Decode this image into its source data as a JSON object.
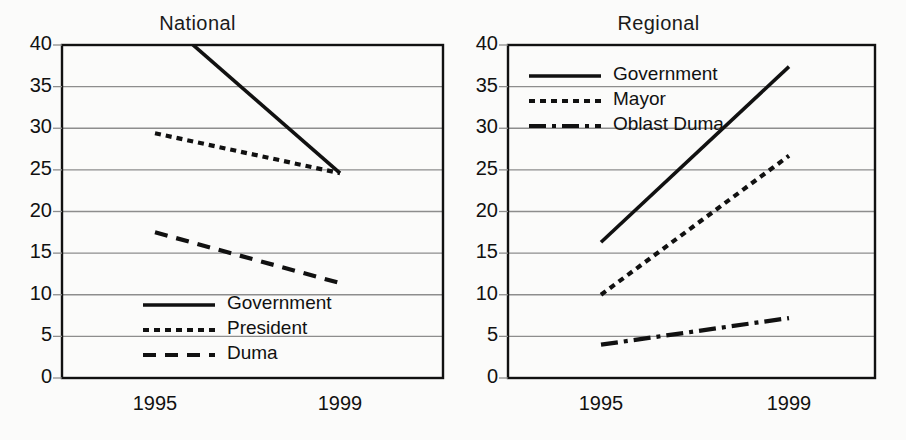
{
  "page": {
    "background_color": "#fbfbfa",
    "ink_color": "#111111",
    "grid_color": "#8d8d8d"
  },
  "charts": [
    {
      "panel_name": "national",
      "title": "National",
      "x_ticks": [
        "1995",
        "1999"
      ],
      "y_ticks": [
        "0",
        "5",
        "10",
        "15",
        "20",
        "25",
        "30",
        "35",
        "40"
      ],
      "legend": [
        {
          "label": "Government",
          "style": "solid"
        },
        {
          "label": "President",
          "style": "dotted"
        },
        {
          "label": "Duma",
          "style": "dashed"
        }
      ]
    },
    {
      "panel_name": "regional",
      "title": "Regional",
      "x_ticks": [
        "1995",
        "1999"
      ],
      "y_ticks": [
        "0",
        "5",
        "10",
        "15",
        "20",
        "25",
        "30",
        "35",
        "40"
      ],
      "legend": [
        {
          "label": "Government",
          "style": "solid"
        },
        {
          "label": "Mayor",
          "style": "dotted"
        },
        {
          "label": "Oblast Duma",
          "style": "dashdot"
        }
      ]
    }
  ],
  "chart_data": [
    {
      "type": "line",
      "title": "National",
      "xlabel": "",
      "ylabel": "",
      "categories": [
        "1995",
        "1999"
      ],
      "x": [
        1995,
        1999
      ],
      "ylim": [
        0,
        40
      ],
      "yticks": [
        0,
        5,
        10,
        15,
        20,
        25,
        30,
        35,
        40
      ],
      "grid": true,
      "legend_position": "bottom-center",
      "series": [
        {
          "name": "Government",
          "style": "solid",
          "values": [
            44.0,
            24.6
          ],
          "note": "line enters from above the 40 axis maximum at 1995; clipped at plot top"
        },
        {
          "name": "President",
          "style": "dotted",
          "values": [
            29.4,
            24.6
          ]
        },
        {
          "name": "Duma",
          "style": "dashed",
          "values": [
            17.5,
            11.4
          ]
        }
      ]
    },
    {
      "type": "line",
      "title": "Regional",
      "xlabel": "",
      "ylabel": "",
      "categories": [
        "1995",
        "1999"
      ],
      "x": [
        1995,
        1999
      ],
      "ylim": [
        0,
        40
      ],
      "yticks": [
        0,
        5,
        10,
        15,
        20,
        25,
        30,
        35,
        40
      ],
      "grid": true,
      "legend_position": "top-left",
      "series": [
        {
          "name": "Government",
          "style": "solid",
          "values": [
            16.3,
            37.4
          ]
        },
        {
          "name": "Mayor",
          "style": "dotted",
          "values": [
            10.0,
            26.7
          ]
        },
        {
          "name": "Oblast Duma",
          "style": "dashdot",
          "values": [
            4.0,
            7.2
          ]
        }
      ]
    }
  ]
}
